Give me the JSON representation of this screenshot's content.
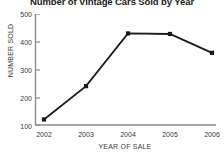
{
  "chart_data": {
    "type": "line",
    "title": "Number of Vintage Cars Sold by Year",
    "xlabel": "YEAR OF SALE",
    "ylabel": "NUMBER SOLD",
    "categories": [
      "2002",
      "2003",
      "2004",
      "2005",
      "2006"
    ],
    "values": [
      120,
      240,
      430,
      428,
      360
    ],
    "series": [
      {
        "name": "Number sold",
        "values": [
          120,
          240,
          430,
          428,
          360
        ]
      }
    ],
    "ylim": [
      100,
      500
    ],
    "yticks": [
      100,
      200,
      300,
      400,
      500
    ],
    "ytick_labels": [
      "100",
      "200",
      "300",
      "400",
      "500"
    ],
    "xtick_labels": [
      "2002",
      "2003",
      "2004",
      "2005",
      "2006"
    ],
    "grid": false,
    "legend": false,
    "legend_position": "none",
    "marker": "square",
    "line_color": "#1a1a1a",
    "marker_color": "#1a1a1a",
    "axis_color": "#8c8c8c",
    "background_color": "#ffffff",
    "text_color": "#3a3a3a",
    "title_color": "#1c1c1c"
  }
}
